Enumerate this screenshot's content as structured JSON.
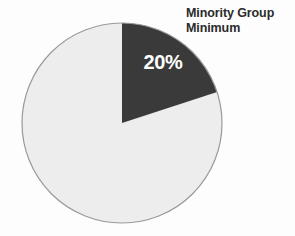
{
  "figure": {
    "name": "minority-group-minimum-pie",
    "background_color": "#fdfdfd"
  },
  "annotation": {
    "line1": "Minority Group",
    "line2": "Minimum",
    "color": "#2b2b2b"
  },
  "slice_label": {
    "text": "20%",
    "color": "#ffffff"
  },
  "chart_data": {
    "type": "pie",
    "title": "Minority Group Minimum",
    "xlabel": "",
    "ylabel": "",
    "legend": false,
    "grid": false,
    "start_angle_deg": 0,
    "direction": "clockwise",
    "center": {
      "x": 122,
      "y": 123
    },
    "radius": 100,
    "labels": [
      "Minority Group Minimum",
      "Remainder"
    ],
    "values": [
      20,
      80
    ],
    "units": "percent",
    "data_labels": [
      "20%",
      ""
    ],
    "colors": [
      "#3a3a3a",
      "#ededed"
    ],
    "edge_color": "#9a9a9a",
    "annotations": [
      {
        "text": "Minority Group Minimum",
        "target_slice": "Minority Group Minimum",
        "position": "top-right"
      }
    ]
  }
}
